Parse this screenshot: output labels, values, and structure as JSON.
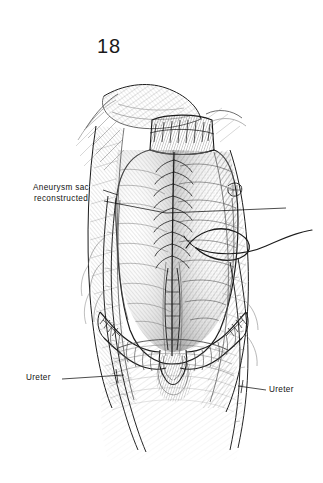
{
  "page": {
    "background_color": "#ffffff",
    "ink_color": "#1b1b1b",
    "width": 323,
    "height": 483
  },
  "figure": {
    "number": "18",
    "kind": "surgical-line-illustration",
    "view": "anterior abdominal exposure, retroperitoneum opened"
  },
  "callouts": [
    {
      "id": "aneurysm-sac",
      "line1": "Aneurysm sac",
      "line2": "reconstructed",
      "text_x": 13,
      "text_y": 183,
      "leader_from": [
        104,
        193
      ],
      "leader_to": [
        285,
        213
      ]
    },
    {
      "id": "ureter-left",
      "line1": "Ureter",
      "text_x": 26,
      "text_y": 373,
      "leader_from": [
        62,
        379
      ],
      "leader_to": [
        122,
        374
      ]
    },
    {
      "id": "ureter-right",
      "line1": "Ureter",
      "text_x": 269,
      "text_y": 385,
      "leader_from": [
        266,
        390
      ],
      "leader_to": [
        240,
        385
      ]
    }
  ],
  "anatomy": {
    "parts": [
      "aneurysm sac wall",
      "proximal aortic cuff with suture line",
      "running midline closure suture",
      "aortic bifurcation",
      "right common iliac artery",
      "left common iliac artery",
      "right ureter",
      "left ureter",
      "suture needle and thread",
      "retracted peritoneal flap",
      "posterior parietal tissue"
    ]
  }
}
